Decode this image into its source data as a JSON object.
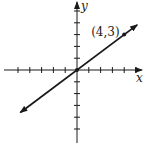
{
  "chart_data": {
    "type": "line",
    "title": "",
    "xlabel": "x",
    "ylabel": "y",
    "xlim": [
      -5,
      5
    ],
    "ylim": [
      -5,
      5
    ],
    "xticks": [
      -5,
      -4,
      -3,
      -2,
      -1,
      1,
      2,
      3,
      4,
      5
    ],
    "yticks": [
      -5,
      -4,
      -3,
      -2,
      -1,
      1,
      2,
      3,
      4,
      5
    ],
    "grid": false,
    "series": [
      {
        "name": "y = 3/4 x",
        "slope": 0.75,
        "intercept": 0,
        "x": [
          -4.8,
          5.1
        ],
        "y": [
          -3.6,
          3.825
        ],
        "arrows": "both",
        "color": "#1a1a1a"
      }
    ],
    "points": [
      {
        "x": 0,
        "y": 0,
        "label": ""
      },
      {
        "x": 4,
        "y": 3,
        "label": "(4,3)"
      }
    ],
    "annotations": [
      {
        "text": "(4,3)",
        "x": 4,
        "y": 3,
        "placement": "left-of-point"
      }
    ]
  }
}
